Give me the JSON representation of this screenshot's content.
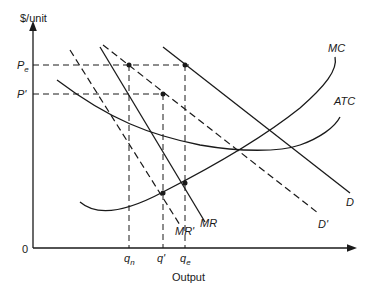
{
  "diagram": {
    "type": "economics-monopoly-cost-curves",
    "y_axis_label": "$/unit",
    "x_axis_label": "Output",
    "origin_label": "0",
    "price_labels": [
      {
        "main": "P",
        "sub": "e"
      },
      {
        "main": "P'",
        "sub": ""
      }
    ],
    "quantity_labels": [
      {
        "main": "q",
        "sub": "n"
      },
      {
        "main": "q'",
        "sub": ""
      },
      {
        "main": "q",
        "sub": "e"
      }
    ],
    "curve_labels": {
      "mc": "MC",
      "atc": "ATC",
      "d": "D",
      "d_prime": "D'",
      "mr": "MR",
      "mr_prime": "MR'"
    },
    "colors": {
      "line": "#1a1a1a",
      "background": "#ffffff"
    }
  }
}
